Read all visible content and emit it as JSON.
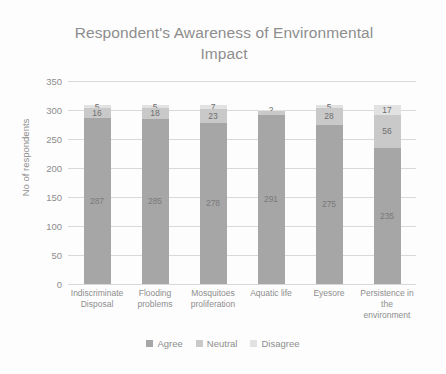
{
  "chart_data": {
    "type": "bar",
    "subtype": "stacked-column",
    "title": "Respondent's Awareness of Environmental Impact",
    "xlabel": "",
    "ylabel": "No of respondents",
    "ylim": [
      0,
      350
    ],
    "ytick_step": 50,
    "yticks": [
      350,
      300,
      250,
      200,
      150,
      100,
      50,
      0
    ],
    "grid": true,
    "legend_position": "bottom",
    "categories": [
      "Indiscriminate Disposal",
      "Flooding problems",
      "Mosquitoes proliferation",
      "Aquatic life",
      "Eyesore",
      "Persistence in the environment"
    ],
    "series": [
      {
        "name": "Agree",
        "color": "#a6a6a6",
        "values": [
          287,
          285,
          278,
          291,
          275,
          235
        ],
        "labels": [
          "287",
          "285",
          "278",
          "291",
          "275",
          "235"
        ]
      },
      {
        "name": "Neutral",
        "color": "#c9c9c9",
        "values": [
          16,
          18,
          23,
          7,
          28,
          56
        ],
        "labels": [
          "16",
          "18",
          "23",
          "",
          "28",
          "56"
        ]
      },
      {
        "name": "Disagree",
        "color": "#e2e2e2",
        "values": [
          5,
          5,
          7,
          2,
          5,
          17
        ],
        "labels": [
          "5",
          "5",
          "7",
          "2",
          "5",
          "17"
        ]
      }
    ]
  },
  "legend": {
    "items": [
      {
        "label": "Agree",
        "color": "#a6a6a6"
      },
      {
        "label": "Neutral",
        "color": "#c9c9c9"
      },
      {
        "label": "Disagree",
        "color": "#e2e2e2"
      }
    ]
  },
  "colors": {
    "background": "#fdfdfd",
    "gridline": "#d9d9d9",
    "text": "#8d8d8d",
    "data_label": "#6f6f6f"
  }
}
